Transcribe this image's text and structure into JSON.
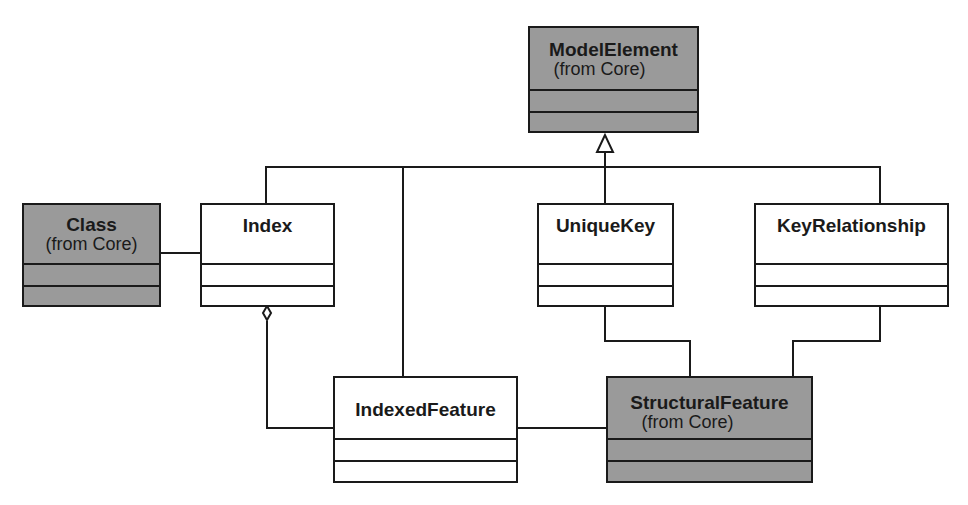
{
  "diagram": {
    "type": "UML class diagram",
    "colors": {
      "shaded": "#9a9a9a",
      "plain": "#ffffff",
      "line": "#1a1a1a"
    },
    "classes": {
      "model_element": {
        "name": "ModelElement",
        "package": "(from Core)",
        "shaded": true
      },
      "class": {
        "name": "Class",
        "package": "(from Core)",
        "shaded": true
      },
      "index": {
        "name": "Index",
        "shaded": false
      },
      "unique_key": {
        "name": "UniqueKey",
        "shaded": false
      },
      "key_relationship": {
        "name": "KeyRelationship",
        "shaded": false
      },
      "indexed_feature": {
        "name": "IndexedFeature",
        "shaded": false
      },
      "structural_feature": {
        "name": "StructuralFeature",
        "package": "(from Core)",
        "shaded": true
      }
    },
    "relationships": [
      {
        "type": "generalization",
        "from": "Index",
        "to": "ModelElement"
      },
      {
        "type": "generalization",
        "from": "IndexedFeature",
        "to": "ModelElement"
      },
      {
        "type": "generalization",
        "from": "UniqueKey",
        "to": "ModelElement"
      },
      {
        "type": "generalization",
        "from": "KeyRelationship",
        "to": "ModelElement"
      },
      {
        "type": "association",
        "from": "Class",
        "to": "Index"
      },
      {
        "type": "aggregation",
        "from": "Index",
        "to": "IndexedFeature"
      },
      {
        "type": "association",
        "from": "IndexedFeature",
        "to": "StructuralFeature"
      },
      {
        "type": "association",
        "from": "UniqueKey",
        "to": "StructuralFeature"
      },
      {
        "type": "association",
        "from": "KeyRelationship",
        "to": "StructuralFeature"
      }
    ]
  }
}
